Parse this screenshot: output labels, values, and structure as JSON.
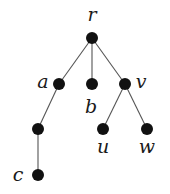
{
  "diagram": {
    "type": "rooted-tree",
    "nodes": [
      {
        "id": "r",
        "label": "r"
      },
      {
        "id": "a",
        "label": "a"
      },
      {
        "id": "b",
        "label": "b"
      },
      {
        "id": "v",
        "label": "v"
      },
      {
        "id": "a1",
        "label": ""
      },
      {
        "id": "c",
        "label": "c"
      },
      {
        "id": "u",
        "label": "u"
      },
      {
        "id": "w",
        "label": "w"
      }
    ],
    "edges": [
      [
        "r",
        "a"
      ],
      [
        "r",
        "b"
      ],
      [
        "r",
        "v"
      ],
      [
        "a",
        "a1"
      ],
      [
        "a1",
        "c"
      ],
      [
        "v",
        "u"
      ],
      [
        "v",
        "w"
      ]
    ]
  }
}
